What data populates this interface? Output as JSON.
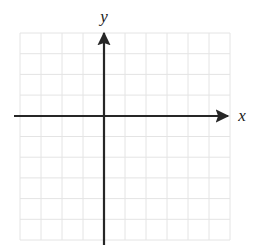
{
  "figure": {
    "kind": "cartesian-coordinate-grid",
    "width": 253,
    "height": 250,
    "background_color": "#ffffff"
  },
  "labels": {
    "y_axis": "y",
    "x_axis": "x"
  },
  "chart_data": {
    "type": "scatter",
    "title": "",
    "subtitle": "",
    "xlabel": "x",
    "ylabel": "y",
    "series": [
      {
        "name": "",
        "x": [],
        "y": []
      }
    ],
    "x": [],
    "values": [],
    "categories": [],
    "xlim": [
      -4,
      6
    ],
    "ylim": [
      -6,
      4
    ],
    "xticks": [
      -4,
      -3,
      -2,
      -1,
      0,
      1,
      2,
      3,
      4,
      5,
      6
    ],
    "yticks": [
      -6,
      -5,
      -4,
      -3,
      -2,
      -1,
      0,
      1,
      2,
      3,
      4
    ],
    "xticklabels": [],
    "yticklabels": [],
    "grid": true,
    "grid_columns": 10,
    "grid_rows": 10,
    "legend": false,
    "legend_position": "none",
    "annotations": []
  },
  "geometry": {
    "grid": {
      "left": 20,
      "top": 33,
      "right": 230,
      "bottom": 240,
      "cell_width": 21,
      "cell_height": 20.7,
      "columns": 10,
      "rows": 10,
      "line_color": "#e4e4e4",
      "line_width": 1
    },
    "x_axis": {
      "y": 116,
      "start_x": 14,
      "end_x": 228,
      "color": "#262626",
      "line_width": 2.2,
      "arrow": "end"
    },
    "y_axis": {
      "x": 104,
      "start_y": 245,
      "end_y": 33,
      "color": "#262626",
      "line_width": 2.2,
      "arrow": "end"
    }
  },
  "colors": {
    "axis": "#262626",
    "grid": "#e4e4e4",
    "label": "#1a1a1a",
    "background": "#ffffff"
  }
}
